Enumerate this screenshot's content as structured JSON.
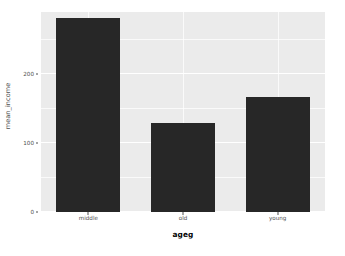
{
  "chart_data": {
    "type": "bar",
    "title": "",
    "subtitle": "",
    "xlabel": "ageg",
    "ylabel": "mean_income",
    "categories": [
      "middle",
      "old",
      "young"
    ],
    "values": [
      281,
      129,
      167
    ],
    "series": [
      {
        "name": "mean_income",
        "values": [
          281,
          129,
          167
        ]
      }
    ],
    "ylim": [
      0,
      290
    ],
    "y_ticks": [
      0,
      100,
      200
    ],
    "y_tick_labels": [
      "0",
      "100",
      "200"
    ],
    "y_minor_ticks": [
      50,
      150,
      250
    ],
    "grid": true,
    "legend": "none",
    "bar_color": "#272727",
    "panel_background": "#ebebeb",
    "gridline_color": "#ffffff",
    "axis_text_color": "#4d4d4d",
    "axis_title_color": "#000000"
  },
  "axes": {
    "y_title": "mean_income",
    "x_title": "ageg"
  }
}
